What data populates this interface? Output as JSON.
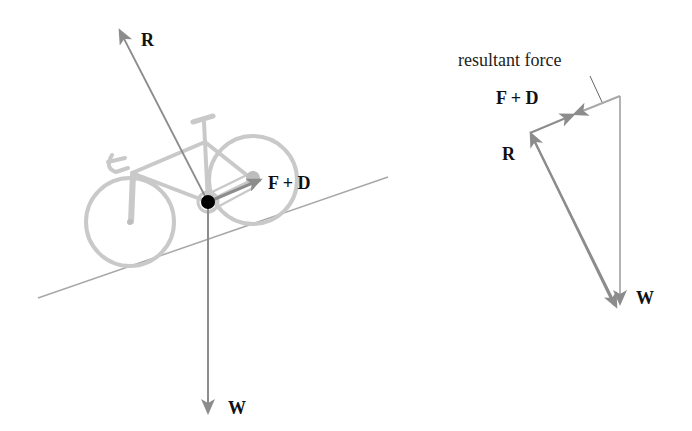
{
  "left_diagram": {
    "labels": {
      "reaction": "R",
      "forward_drag": "F + D",
      "weight": "W"
    }
  },
  "right_diagram": {
    "labels": {
      "resultant": "resultant force",
      "forward_drag": "F + D",
      "reaction": "R",
      "weight": "W"
    }
  },
  "colors": {
    "arrow": "#8c8c8c",
    "bike": "#c8c8c8",
    "slope": "#9a9a9a",
    "dot": "#000000",
    "text": "#111111"
  }
}
